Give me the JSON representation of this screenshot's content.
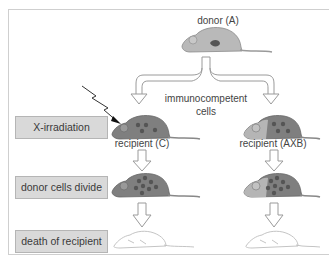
{
  "diagram": {
    "donor_label": "donor (A)",
    "cells_label_line1": "immunocompetent",
    "cells_label_line2": "cells",
    "left_recipient_label": "recipient (C)",
    "right_recipient_label": "recipient (AXB)",
    "steps": [
      {
        "label": "X-irradiation"
      },
      {
        "label": "donor cells divide"
      },
      {
        "label": "death of recipient"
      }
    ],
    "colors": {
      "donor_mouse": "#b9b9b9",
      "recipient_mouse": "#7f7f7f",
      "cell_dot": "#555555",
      "label_box": "#d9d9d9",
      "dead_mouse_outline": "#bdbdbd"
    }
  }
}
